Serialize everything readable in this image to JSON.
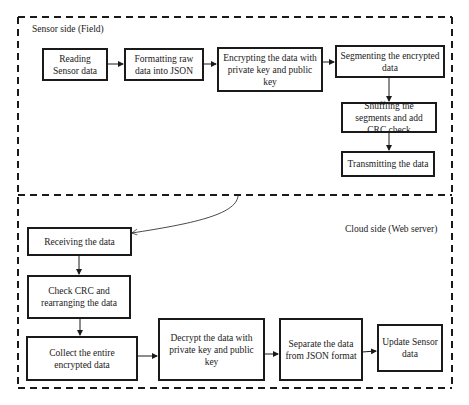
{
  "sensor_side": {
    "label": "Sensor side (Field)",
    "steps": [
      {
        "id": "reading",
        "text": "Reading Sensor data"
      },
      {
        "id": "formatting",
        "text": "Formatting raw data into JSON"
      },
      {
        "id": "encrypting",
        "text": "Encrypting the data with private key and public key"
      },
      {
        "id": "segmenting",
        "text": "Segmenting the encrypted data"
      },
      {
        "id": "shuffling",
        "text": "Shuffling the segments and add CRC check"
      },
      {
        "id": "transmitting",
        "text": "Transmitting the data"
      }
    ]
  },
  "cloud_side": {
    "label": "Cloud side (Web server)",
    "steps": [
      {
        "id": "receiving",
        "text": "Receiving the data"
      },
      {
        "id": "check_crc",
        "text": "Check CRC and rearranging the data"
      },
      {
        "id": "collect",
        "text": "Collect the entire encrypted data"
      },
      {
        "id": "decrypt",
        "text": "Decrypt the data with private key and public key"
      },
      {
        "id": "separate",
        "text": "Separate the data from JSON format"
      },
      {
        "id": "update",
        "text": "Update Sensor data"
      }
    ]
  },
  "colors": {
    "stroke": "#1a1a1a",
    "background": "#ffffff"
  }
}
